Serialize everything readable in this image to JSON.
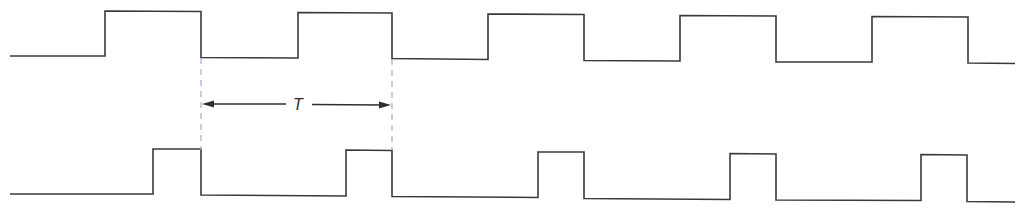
{
  "diagram": {
    "type": "timing-diagram",
    "colors": {
      "waveform": "#3a3a3a",
      "guide_lines": "#9fb0cf",
      "dimension": "#2e2e2e",
      "background": "#ffffff"
    },
    "period_label": "T",
    "waveforms": [
      {
        "name": "upper-square-wave",
        "description": "square wave, ~50% duty cycle",
        "x_start": 10,
        "x_end": 1015,
        "rising_edges": [
          105,
          298,
          488,
          680,
          872
        ],
        "falling_edges": [
          201,
          392,
          584,
          776,
          968
        ],
        "low_level_y": [
          56,
          63
        ],
        "high_level_y": [
          11,
          17
        ]
      },
      {
        "name": "lower-pulse-wave",
        "description": "narrow pulse train, ~25% duty cycle, falling edges aligned with upper wave",
        "x_start": 10,
        "x_end": 1015,
        "rising_edges": [
          153,
          346,
          538,
          730,
          921
        ],
        "falling_edges": [
          201,
          392,
          584,
          776,
          967
        ],
        "low_level_y": [
          194,
          202
        ],
        "high_level_y": [
          149,
          155
        ]
      }
    ],
    "period_marker": {
      "x_from": 201,
      "x_to": 392,
      "y": 104,
      "guide_y_top": 58,
      "guide_y_bottom": 150
    }
  }
}
